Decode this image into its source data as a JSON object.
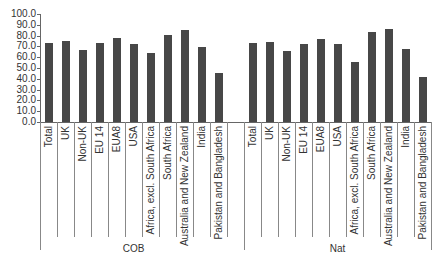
{
  "chart_data": {
    "type": "bar",
    "title": "",
    "xlabel": "",
    "ylabel": "",
    "ylim": [
      0,
      100
    ],
    "yticks": [
      "0.0",
      "10.0",
      "20.0",
      "30.0",
      "40.0",
      "50.0",
      "60.0",
      "70.0",
      "80.0",
      "90.0",
      "100.0"
    ],
    "grid": false,
    "legend": null,
    "groups": [
      {
        "name": "COB",
        "categories": [
          "Total",
          "UK",
          "Non-UK",
          "EU 14",
          "EUA8",
          "USA",
          "Africa, excl. South Africa",
          "South Africa",
          "Australia and New Zealand",
          "India",
          "Pakistan and Bangladesh"
        ],
        "values": [
          73.5,
          75.0,
          67.0,
          73.5,
          77.5,
          72.5,
          64.0,
          80.5,
          85.0,
          69.0,
          45.0
        ]
      },
      {
        "name": "Nat",
        "categories": [
          "Total",
          "UK",
          "Non-UK",
          "EU 14",
          "EUA8",
          "USA",
          "Africa, excl. South Africa",
          "South Africa",
          "Australia and New Zealand",
          "India",
          "Pakistan and Bangladesh"
        ],
        "values": [
          73.0,
          74.0,
          65.5,
          72.0,
          76.5,
          72.5,
          56.0,
          83.0,
          86.5,
          68.0,
          42.0
        ]
      }
    ]
  },
  "colors": {
    "bar": "#474747",
    "axis": "#666666"
  }
}
